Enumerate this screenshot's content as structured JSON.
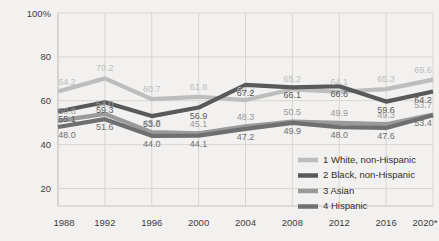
{
  "chart_data": {
    "type": "line",
    "title": "",
    "subtitle": "",
    "xlabel": "",
    "ylabel": "",
    "x": [
      "1988",
      "1992",
      "1996",
      "2000",
      "2004",
      "2008",
      "2012",
      "2016",
      "2020*"
    ],
    "xtick_labels": [
      "1988",
      "1992",
      "1996",
      "2000",
      "2004",
      "2008",
      "2012",
      "2016",
      "2020*"
    ],
    "ytick_labels": [
      "100%",
      "80",
      "60",
      "40",
      "20"
    ],
    "ytick_values": [
      100,
      80,
      60,
      40,
      20
    ],
    "ylim": [
      12,
      100
    ],
    "grid": true,
    "grid_orientation": "both",
    "legend_position": "bottom-right",
    "series": [
      {
        "name": "1 White, non-Hispanic",
        "legend_number": "1",
        "color": "#bdbdbd",
        "values": [
          64.2,
          70.2,
          60.7,
          61.8,
          60.3,
          65.2,
          64.1,
          65.3,
          69.6
        ],
        "labels": [
          "64.2",
          "70.2",
          "60.7",
          "61.8",
          "60.3",
          "65.2",
          "64.1",
          "65.3",
          "69.6"
        ]
      },
      {
        "name": "2 Black, non-Hispanic",
        "legend_number": "2",
        "color": "#58595b",
        "values": [
          55.1,
          59.3,
          53.0,
          56.9,
          67.2,
          66.1,
          66.6,
          59.6,
          64.2
        ],
        "labels": [
          "55.1",
          "59.3",
          "53.0",
          "56.9",
          "67.2",
          "66.1",
          "66.6",
          "59.6",
          "64.2"
        ]
      },
      {
        "name": "3 Asian",
        "legend_number": "3",
        "color": "#9a9a9a",
        "values": [
          50.8,
          54.0,
          45.7,
          45.1,
          48.3,
          50.5,
          49.9,
          49.3,
          53.7
        ],
        "labels": [
          "50.8",
          "54.0",
          "45.7",
          "45.1",
          "48.3",
          "50.5",
          "49.9",
          "49.3",
          "53.7"
        ]
      },
      {
        "name": "4 Hispanic",
        "legend_number": "4",
        "color": "#6e6f71",
        "values": [
          48.0,
          51.6,
          44.0,
          44.1,
          47.2,
          49.9,
          48.0,
          47.6,
          53.4
        ],
        "labels": [
          "48.0",
          "51.6",
          "44.0",
          "44.1",
          "47.2",
          "49.9",
          "48.0",
          "47.6",
          "53.4"
        ]
      }
    ]
  },
  "legend": {
    "items": [
      {
        "label": "1 White, non-Hispanic",
        "color": "#bdbdbd"
      },
      {
        "label": "2 Black, non-Hispanic",
        "color": "#58595b"
      },
      {
        "label": "3 Asian",
        "color": "#9a9a9a"
      },
      {
        "label": "4 Hispanic",
        "color": "#6e6f71"
      }
    ]
  },
  "colors": {
    "background": "#f2f1ef",
    "grid": "#d8d6d2",
    "axis": "#c9c7c3",
    "tick_text": "#3c3c3c"
  }
}
